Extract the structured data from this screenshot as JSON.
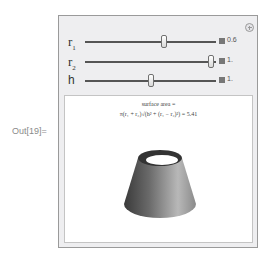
{
  "cell": {
    "output_label": "Out[19]="
  },
  "manipulate": {
    "plus_icon": "plus-circle-icon",
    "controls": [
      {
        "name": "r",
        "sub": "1",
        "value": "0.6",
        "position": 0.6
      },
      {
        "name": "r",
        "sub": "2",
        "value": "1.",
        "position": 0.96
      },
      {
        "name": "h",
        "sub": "",
        "value": "1.",
        "position": 0.5
      }
    ],
    "display": {
      "caption_line1": "surface area =",
      "caption_line2": "π(r₁ + r₂)√(h² + (r₁ − r₂)²)  = 5.41",
      "graphic": "truncated-cone-surface"
    }
  }
}
